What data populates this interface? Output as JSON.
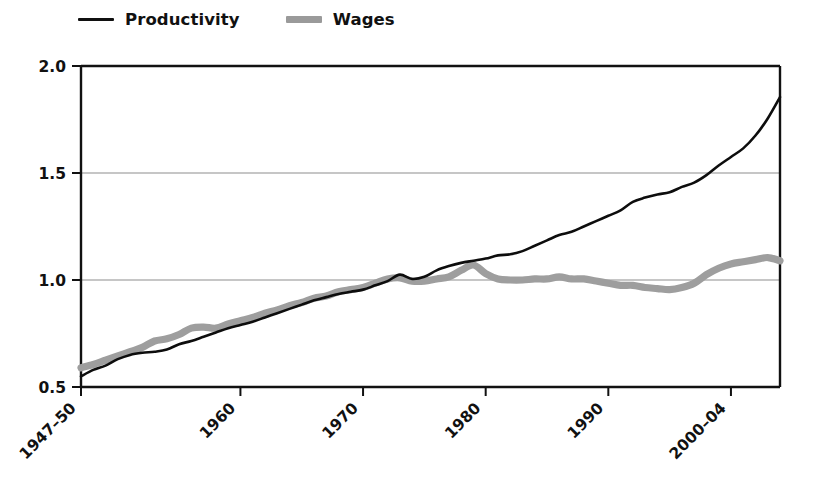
{
  "legend": {
    "position": "top-left",
    "entries": [
      {
        "label": "Productivity",
        "icon": "line-swatch-black",
        "color": "#101010"
      },
      {
        "label": "Wages",
        "icon": "line-swatch-gray",
        "color": "#9a9a9a"
      }
    ]
  },
  "chart_data": {
    "type": "line",
    "title": "",
    "subtitle": "",
    "xlabel": "",
    "ylabel": "",
    "xlim": [
      1947,
      2004
    ],
    "ylim": [
      0.5,
      2.0
    ],
    "grid": true,
    "legend_position": "top-left",
    "x_tick_labels": [
      "1947–50",
      "1960",
      "1970",
      "1980",
      "1990",
      "2000–04"
    ],
    "x_tick_values": [
      1947,
      1960,
      1970,
      1980,
      1990,
      2000
    ],
    "y_tick_labels": [
      "0.5",
      "1.0",
      "1.5",
      "2.0"
    ],
    "y_tick_values": [
      0.5,
      1.0,
      1.5,
      2.0
    ],
    "x": [
      1947,
      1948,
      1949,
      1950,
      1951,
      1952,
      1953,
      1954,
      1955,
      1956,
      1957,
      1958,
      1959,
      1960,
      1961,
      1962,
      1963,
      1964,
      1965,
      1966,
      1967,
      1968,
      1969,
      1970,
      1971,
      1972,
      1973,
      1974,
      1975,
      1976,
      1977,
      1978,
      1979,
      1980,
      1981,
      1982,
      1983,
      1984,
      1985,
      1986,
      1987,
      1988,
      1989,
      1990,
      1991,
      1992,
      1993,
      1994,
      1995,
      1996,
      1997,
      1998,
      1999,
      2000,
      2001,
      2002,
      2003,
      2004
    ],
    "series": [
      {
        "name": "Productivity",
        "color": "#0d0d0d",
        "style": "thin-solid",
        "values": [
          0.55,
          0.58,
          0.6,
          0.63,
          0.65,
          0.66,
          0.665,
          0.675,
          0.7,
          0.715,
          0.735,
          0.755,
          0.775,
          0.79,
          0.805,
          0.825,
          0.845,
          0.865,
          0.885,
          0.905,
          0.92,
          0.935,
          0.945,
          0.955,
          0.975,
          0.995,
          1.025,
          1.005,
          1.015,
          1.045,
          1.065,
          1.08,
          1.09,
          1.1,
          1.115,
          1.12,
          1.135,
          1.16,
          1.185,
          1.21,
          1.225,
          1.25,
          1.275,
          1.3,
          1.325,
          1.365,
          1.385,
          1.4,
          1.41,
          1.435,
          1.455,
          1.49,
          1.535,
          1.575,
          1.615,
          1.675,
          1.755,
          1.855
        ]
      },
      {
        "name": "Wages",
        "color": "#9e9e9e",
        "style": "thick-solid",
        "values": [
          0.59,
          0.605,
          0.625,
          0.645,
          0.665,
          0.685,
          0.715,
          0.725,
          0.745,
          0.775,
          0.78,
          0.775,
          0.795,
          0.81,
          0.825,
          0.845,
          0.86,
          0.88,
          0.895,
          0.915,
          0.925,
          0.945,
          0.955,
          0.965,
          0.985,
          1.005,
          1.01,
          0.995,
          0.995,
          1.005,
          1.015,
          1.045,
          1.07,
          1.03,
          1.005,
          1.0,
          1.0,
          1.005,
          1.005,
          1.015,
          1.005,
          1.005,
          0.995,
          0.985,
          0.975,
          0.975,
          0.965,
          0.96,
          0.955,
          0.965,
          0.985,
          1.025,
          1.055,
          1.075,
          1.085,
          1.095,
          1.105,
          1.09
        ]
      }
    ]
  }
}
